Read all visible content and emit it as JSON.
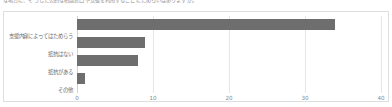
{
  "caption": {
    "text": "な場合に、そうした公的な相談窓口や支援を利用することにためらいはありますか。"
  },
  "chart_data": {
    "type": "bar",
    "orientation": "horizontal",
    "title": "",
    "xlabel": "",
    "ylabel": "",
    "categories": [
      "支援内容によってはためらう",
      "抵抗はない",
      "抵抗がある",
      "その他"
    ],
    "values": [
      34,
      9,
      8,
      1
    ],
    "xlim": [
      0,
      40
    ],
    "xticks": [
      0,
      10,
      20,
      30,
      40
    ],
    "xtick_labels": [
      "0",
      "10",
      "20",
      "30",
      "40"
    ],
    "grid": true,
    "grid_axis": "x",
    "legend": false,
    "bar_color": "#6e6e6e",
    "gridline_color": "#e6e6e6",
    "frame_color": "#dedede",
    "background": "#ffffff",
    "text_color": "#6d6d6d"
  }
}
